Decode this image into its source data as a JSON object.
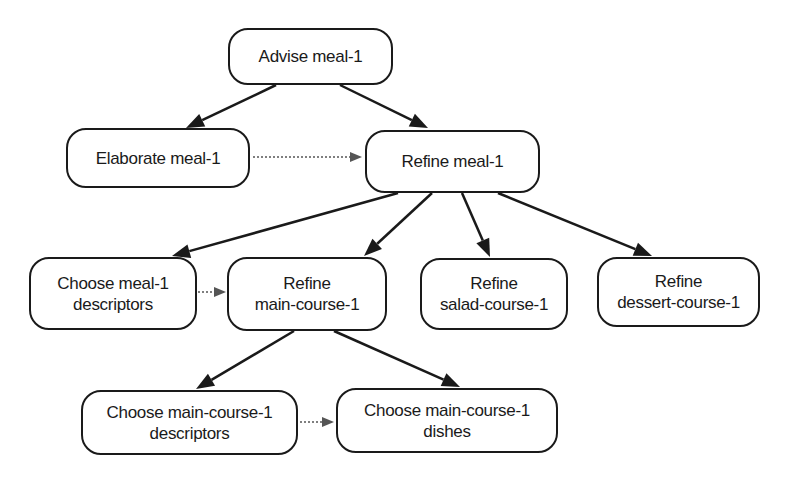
{
  "diagram": {
    "type": "task-decomposition-tree",
    "nodes": [
      {
        "id": "advise-meal",
        "lines": [
          "Advise meal-1"
        ],
        "box": [
          228,
          28,
          165,
          57
        ]
      },
      {
        "id": "elaborate-meal",
        "lines": [
          "Elaborate meal-1"
        ],
        "box": [
          66,
          128,
          184,
          60
        ]
      },
      {
        "id": "refine-meal",
        "lines": [
          "Refine meal-1"
        ],
        "box": [
          365,
          130,
          175,
          63
        ]
      },
      {
        "id": "choose-meal-descriptors",
        "lines": [
          "Choose meal-1",
          "descriptors"
        ],
        "box": [
          29,
          257,
          168,
          73
        ]
      },
      {
        "id": "refine-main-course",
        "lines": [
          "Refine",
          "main-course-1"
        ],
        "box": [
          227,
          257,
          160,
          74
        ]
      },
      {
        "id": "refine-salad-course",
        "lines": [
          "Refine",
          "salad-course-1"
        ],
        "box": [
          420,
          258,
          148,
          72
        ]
      },
      {
        "id": "refine-dessert-course",
        "lines": [
          "Refine",
          "dessert-course-1"
        ],
        "box": [
          597,
          257,
          163,
          70
        ]
      },
      {
        "id": "choose-main-course-descriptors",
        "lines": [
          "Choose main-course-1",
          "descriptors"
        ],
        "box": [
          81,
          390,
          217,
          65
        ]
      },
      {
        "id": "choose-main-course-dishes",
        "lines": [
          "Choose main-course-1",
          "dishes"
        ],
        "box": [
          336,
          388,
          222,
          65
        ]
      }
    ],
    "edges": [
      {
        "from": "advise-meal",
        "to": "elaborate-meal",
        "style": "solid",
        "points": [
          276,
          85,
          186,
          128
        ]
      },
      {
        "from": "advise-meal",
        "to": "refine-meal",
        "style": "solid",
        "points": [
          340,
          85,
          428,
          128
        ]
      },
      {
        "from": "elaborate-meal",
        "to": "refine-meal",
        "style": "dotted",
        "points": [
          253,
          157,
          362,
          157
        ]
      },
      {
        "from": "refine-meal",
        "to": "choose-meal-descriptors",
        "style": "solid",
        "points": [
          398,
          193,
          172,
          256
        ]
      },
      {
        "from": "refine-meal",
        "to": "refine-main-course",
        "style": "solid",
        "points": [
          432,
          193,
          364,
          256
        ]
      },
      {
        "from": "refine-meal",
        "to": "refine-salad-course",
        "style": "solid",
        "points": [
          462,
          193,
          490,
          257
        ]
      },
      {
        "from": "refine-meal",
        "to": "refine-dessert-course",
        "style": "solid",
        "points": [
          498,
          193,
          652,
          256
        ]
      },
      {
        "from": "choose-meal-descriptors",
        "to": "refine-main-course",
        "style": "dotted",
        "points": [
          198,
          292,
          226,
          292
        ]
      },
      {
        "from": "refine-main-course",
        "to": "choose-main-course-descriptors",
        "style": "solid",
        "points": [
          294,
          331,
          196,
          389
        ]
      },
      {
        "from": "refine-main-course",
        "to": "choose-main-course-dishes",
        "style": "solid",
        "points": [
          334,
          331,
          460,
          387
        ]
      },
      {
        "from": "choose-main-course-descriptors",
        "to": "choose-main-course-dishes",
        "style": "dotted",
        "points": [
          300,
          422,
          334,
          422
        ]
      }
    ],
    "colors": {
      "line": "#1a1a1a",
      "dotted": "#555555",
      "background": "#ffffff"
    }
  }
}
